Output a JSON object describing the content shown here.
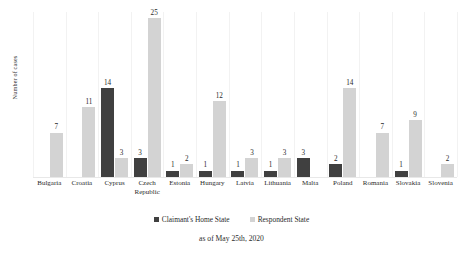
{
  "chart_data": {
    "type": "bar",
    "title": "",
    "subtitle": "",
    "xlabel": "",
    "ylabel": "Number of cases",
    "ylim": [
      0,
      26
    ],
    "grid": "vertical-category-separators",
    "legend_position": "bottom-center",
    "categories": [
      "Bulgaria",
      "Croatia",
      "Cyprus",
      "Czech Republic",
      "Estonia",
      "Hungary",
      "Latvia",
      "Lithuania",
      "Malta",
      "Poland",
      "Romania",
      "Slovakia",
      "Slovenia"
    ],
    "series": [
      {
        "name": "Claimant's Home State",
        "color": "#404040",
        "values": [
          null,
          null,
          14,
          3,
          1,
          1,
          1,
          1,
          3,
          2,
          null,
          1,
          null
        ]
      },
      {
        "name": "Respondent State",
        "color": "#d3d3d3",
        "values": [
          7,
          11,
          3,
          25,
          2,
          12,
          3,
          3,
          null,
          14,
          7,
          9,
          2
        ]
      }
    ],
    "annotation": "as of May 25th, 2020"
  },
  "axis": {
    "y_title": "Number of cases"
  },
  "legend": {
    "items": [
      {
        "label": "Claimant's Home State",
        "swatch": "claimant"
      },
      {
        "label": "Respondent State",
        "swatch": "respondent"
      }
    ]
  },
  "footer": {
    "note": "as of May 25th, 2020"
  }
}
